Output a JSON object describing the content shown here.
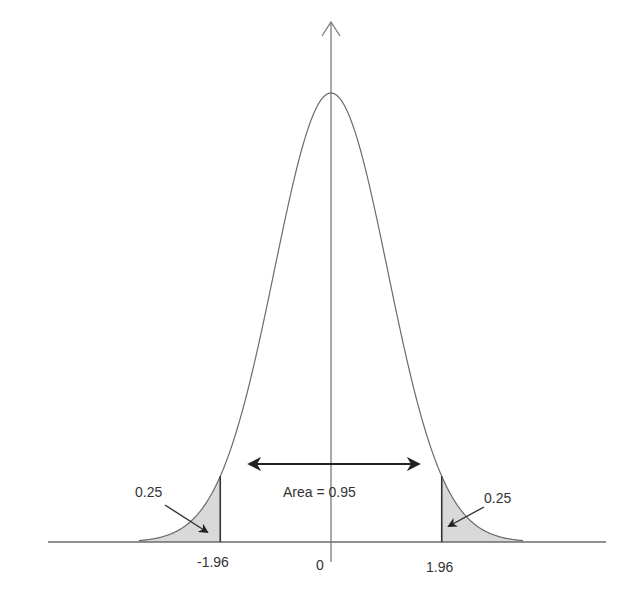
{
  "chart_data": {
    "type": "line",
    "title": "",
    "xlabel": "",
    "ylabel": "",
    "distribution": "standard normal",
    "mean": 0,
    "sd": 1,
    "x_ticks": [
      "-1.96",
      "0",
      "1.96"
    ],
    "critical_values": [
      -1.96,
      1.96
    ],
    "shaded_regions": [
      {
        "from": "-inf",
        "to": -1.96,
        "label": "0.25",
        "label_as_printed": true,
        "correct_value": 0.025
      },
      {
        "from": 1.96,
        "to": "inf",
        "label": "0.25",
        "label_as_printed": true,
        "correct_value": 0.025
      }
    ],
    "central_area": {
      "from": -1.96,
      "to": 1.96,
      "label": "Area = 0.95",
      "value": 0.95
    },
    "annotation_note": "The tail labels read 0.25 in the original image, but the correct tail area beyond ±1.96 for a standard normal is 0.025 (0.025 + 0.95 + 0.025 = 1). The 0.25 labels are an error in the source figure.",
    "axes": {
      "x_axis_arrow": false,
      "y_axis_arrow": true
    },
    "grid": false,
    "legend": null
  },
  "labels": {
    "left_tail": "0.25",
    "right_tail": "0.25",
    "center_area": "Area = 0.95",
    "tick_neg": "-1.96",
    "tick_zero": "0",
    "tick_pos": "1.96"
  },
  "colors": {
    "curve": "#6b6b6b",
    "axis": "#6b6b6b",
    "shade": "#d9d9d9",
    "arrow": "#222222",
    "text": "#333333"
  }
}
